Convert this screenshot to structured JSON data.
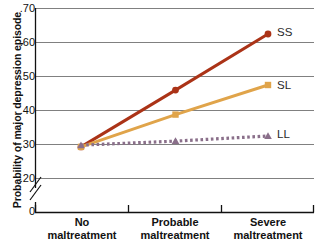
{
  "chart_data": {
    "type": "line",
    "title": "",
    "xlabel": "",
    "ylabel": "Probability of major depression episode",
    "categories": [
      "No maltreatment",
      "Probable maltreatment",
      "Severe maltreatment"
    ],
    "ylim": [
      0.2,
      0.7
    ],
    "y_axis_break": true,
    "y_axis_break_base": "0",
    "yticks": [
      ".70",
      ".60",
      ".50",
      ".40",
      ".30",
      ".20"
    ],
    "ytick_values": [
      0.7,
      0.6,
      0.5,
      0.4,
      0.3,
      0.2
    ],
    "grid": true,
    "legend_position": "right-inline",
    "series": [
      {
        "name": "SS",
        "label": "SS",
        "color": "#ab3317",
        "marker": "circle",
        "linestyle": "solid",
        "values": [
          0.293,
          0.46,
          0.625
        ]
      },
      {
        "name": "SL",
        "label": "SL",
        "color": "#e0a44a",
        "marker": "square",
        "linestyle": "solid",
        "values": [
          0.293,
          0.388,
          0.475
        ]
      },
      {
        "name": "LL",
        "label": "LL",
        "color": "#8a6f8a",
        "marker": "triangle",
        "linestyle": "dotted",
        "values": [
          0.298,
          0.31,
          0.325
        ]
      }
    ]
  },
  "axis": {
    "y_label": "Probability of major depression episode",
    "y_ticks": {
      "t70": ".70",
      "t60": ".60",
      "t50": ".50",
      "t40": ".40",
      "t30": ".30",
      "t20": ".20",
      "zero": "0"
    },
    "x_ticks": [
      {
        "line1": "No",
        "line2": "maltreatment"
      },
      {
        "line1": "Probable",
        "line2": "maltreatment"
      },
      {
        "line1": "Severe",
        "line2": "maltreatment"
      }
    ]
  },
  "legend": {
    "ss": "SS",
    "sl": "SL",
    "ll": "LL"
  },
  "colors": {
    "ss": "#ab3317",
    "sl": "#e0a44a",
    "ll": "#8a6f8a",
    "grid": "#808080",
    "axis": "#111111"
  }
}
